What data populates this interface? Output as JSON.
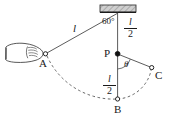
{
  "figure": {
    "colors": {
      "stroke": "#1a1a1a",
      "dashed": "#555555",
      "hatch": "#8c8c8c",
      "ceiling_fill": "#c8c8c8",
      "background": "#ffffff"
    },
    "ceiling": {
      "name": "ceiling-support",
      "hatched": true
    },
    "points": [
      {
        "id": "A",
        "label": "A",
        "style": "open-circle",
        "x": 45,
        "y": 54
      },
      {
        "id": "B",
        "label": "B",
        "style": "open-circle",
        "x": 117,
        "y": 99
      },
      {
        "id": "C",
        "label": "C",
        "style": "open-circle",
        "x": 152,
        "y": 68
      },
      {
        "id": "P",
        "label": "P",
        "style": "filled-dot",
        "x": 117,
        "y": 54
      }
    ],
    "pivot": {
      "name": "pivot-point",
      "x": 118,
      "y": 13
    },
    "labels": {
      "string_length": "l",
      "half_length_upper": {
        "numerator": "l",
        "denominator": "2"
      },
      "half_length_lower": {
        "numerator": "l",
        "denominator": "2"
      },
      "angle_top": "60°",
      "angle_theta": "θ"
    },
    "hand": {
      "name": "hand-holding-bob",
      "description": "hand gripping the bob at point A"
    },
    "segments": [
      {
        "name": "string-pivot-to-A",
        "style": "solid"
      },
      {
        "name": "string-pivot-to-B",
        "style": "solid"
      },
      {
        "name": "string-P-to-C",
        "style": "solid"
      },
      {
        "name": "arc-A-to-B-to-C",
        "style": "dashed"
      },
      {
        "name": "angle-arc-theta",
        "style": "solid"
      }
    ]
  }
}
